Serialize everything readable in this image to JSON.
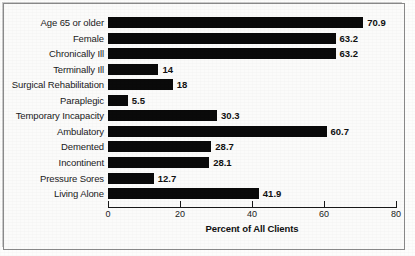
{
  "chart_data": {
    "type": "bar",
    "orientation": "horizontal",
    "title": "",
    "xlabel": "Percent of All Clients",
    "ylabel": "",
    "xlim": [
      0,
      80
    ],
    "xticks": [
      0,
      20,
      40,
      60,
      80
    ],
    "xtick_labels": [
      "0",
      "20",
      "40",
      "60",
      "80"
    ],
    "grid": false,
    "legend": null,
    "bar_color": "#0a0a0a",
    "categories": [
      "Age 65 or older",
      "Female",
      "Chronically Ill",
      "Terminally Ill",
      "Surgical Rehabilitation",
      "Paraplegic",
      "Temporary Incapacity",
      "Ambulatory",
      "Demented",
      "Incontinent",
      "Pressure Sores",
      "Living Alone"
    ],
    "values": [
      70.9,
      63.2,
      63.2,
      14,
      18,
      5.5,
      30.3,
      60.7,
      28.7,
      28.1,
      12.7,
      41.9
    ],
    "value_labels": [
      "70.9",
      "63.2",
      "63.2",
      "14",
      "18",
      "5.5",
      "30.3",
      "60.7",
      "28.7",
      "28.1",
      "12.7",
      "41.9"
    ]
  }
}
